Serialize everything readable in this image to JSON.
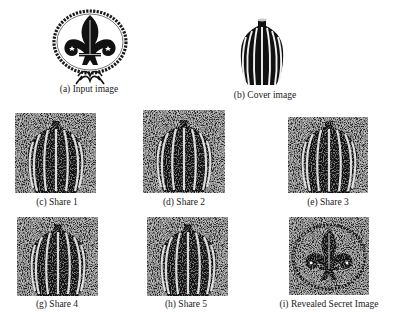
{
  "figure": {
    "panels": [
      {
        "id": "a",
        "label": "(a)  Input image",
        "content": "scout-fleur-de-lis-emblem"
      },
      {
        "id": "b",
        "label": "(b) Cover image",
        "content": "striped-vase"
      },
      {
        "id": "c",
        "label": "(c)  Share 1",
        "content": "noisy-vase-share"
      },
      {
        "id": "d",
        "label": "(d) Share 2",
        "content": "noisy-vase-share"
      },
      {
        "id": "e",
        "label": "(e)  Share 3",
        "content": "noisy-vase-share"
      },
      {
        "id": "g",
        "label": "(g) Share 4",
        "content": "noisy-vase-share"
      },
      {
        "id": "h",
        "label": "(h)   Share 5",
        "content": "noisy-vase-share"
      },
      {
        "id": "i",
        "label": "(i)  Revealed Secret Image",
        "content": "noisy-emblem-reveal"
      }
    ]
  }
}
